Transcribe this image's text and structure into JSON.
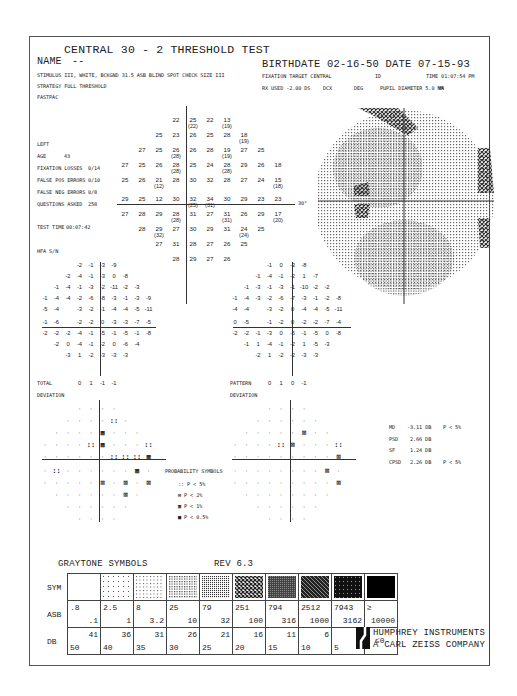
{
  "header": {
    "test_title": "CENTRAL 30 - 2 THRESHOLD TEST",
    "name_label": "NAME",
    "name_value": "--",
    "stimulus": "STIMULUS  III, WHITE, BCKGND 31.5 ASB  BLIND SPOT CHECK SIZE  III",
    "strategy": "STRATEGY  FULL THRESHOLD",
    "fastpac": "FASTPAC",
    "birthdate_line": "BIRTHDATE  02-16-50 DATE  07-15-93",
    "fixation_target": "FIXATION TARGET   CENTRAL",
    "id_label": "ID",
    "time": "TIME  01:07:54 PM",
    "rx_used": "RX USED -2.00 DS",
    "dcx": "DCX",
    "deg": "DEG",
    "pupil": "PUPIL DIAMETER 5.0 MM",
    "va": "VA"
  },
  "patient": {
    "eye": "LEFT",
    "age_label": "AGE",
    "age": "43",
    "fixation_losses_label": "FIXATION LOSSES",
    "fixation_losses": "0/14",
    "false_pos_label": "FALSE POS ERRORS",
    "false_pos": "0/10",
    "false_neg_label": "FALSE NEG ERRORS",
    "false_neg": "0/8",
    "questions_label": "QUESTIONS ASKED",
    "questions": "258",
    "test_time_label": "TEST TIME",
    "test_time": "00:07:42",
    "hfa_sn": "HFA S/N"
  },
  "threshold_rows": [
    [
      "22",
      "25(22)",
      "22",
      "13(19)"
    ],
    [
      "25",
      "23",
      "26",
      "25",
      "28",
      "18(19)"
    ],
    [
      "27",
      "25",
      "26(28)",
      "26",
      "28",
      "19(19)",
      "27",
      "25"
    ],
    [
      "27",
      "25",
      "26",
      "28(28)",
      "25",
      "24",
      "28(28)",
      "29",
      "26",
      "18"
    ],
    [
      "25",
      "26",
      "21(12)",
      "28",
      "30",
      "32",
      "28",
      "27",
      "24",
      "15(18)"
    ],
    [
      "29",
      "25",
      "12",
      "30",
      "32(25)",
      "34(31)",
      "30",
      "29",
      "23",
      "23"
    ],
    [
      "27",
      "28",
      "29",
      "28(28)",
      "31",
      "27",
      "31(31)",
      "26",
      "29",
      "17(20)"
    ],
    [
      "28",
      "29(32)",
      "27",
      "30",
      "29",
      "31",
      "24(24)",
      "25"
    ],
    [
      "27",
      "31",
      "28",
      "27",
      "26",
      "25"
    ],
    [
      "28",
      "29",
      "27",
      "26"
    ]
  ],
  "axis_label_30": "30°",
  "total_deviation": {
    "label1": "TOTAL",
    "label2": "DEVIATION",
    "rows": [
      [
        "-2",
        "-1",
        "-3",
        "-9"
      ],
      [
        "-2",
        "-4",
        "-1",
        "-3",
        "0",
        "-8"
      ],
      [
        "-1",
        "-4",
        "-1",
        "-3",
        "-2",
        "-11",
        "-2",
        "-3"
      ],
      [
        "-1",
        "-4",
        "-4",
        "-2",
        "-6",
        "-8",
        "-3",
        "-1",
        "-3",
        "-9"
      ],
      [
        "-5",
        "-4",
        "-3",
        "-2",
        "-1",
        "-4",
        "-4",
        "-5",
        "-11"
      ],
      [
        "-1",
        "-6",
        "-2",
        "-2",
        "0",
        "-3",
        "-3",
        "-7",
        "-5"
      ],
      [
        "-2",
        "-2",
        "-2",
        "-4",
        "-1",
        "-5",
        "-1",
        "-5",
        "-1",
        "-8"
      ],
      [
        "-2",
        "0",
        "-4",
        "-1",
        "-2",
        "0",
        "-6",
        "-4"
      ],
      [
        "-3",
        "1",
        "-2",
        "-3",
        "-3",
        "-3"
      ],
      [
        "0",
        "1",
        "-1",
        "-1"
      ]
    ]
  },
  "pattern_deviation": {
    "label1": "PATTERN",
    "label2": "DEVIATION",
    "rows": [
      [
        "-1",
        "0",
        "-3",
        "-8"
      ],
      [
        "-1",
        "-4",
        "-1",
        "-2",
        "1",
        "-7"
      ],
      [
        "-1",
        "-3",
        "-1",
        "-3",
        "-1",
        "-10",
        "-2",
        "-2"
      ],
      [
        "-1",
        "-4",
        "-3",
        "-2",
        "-6",
        "-7",
        "-3",
        "-1",
        "-2",
        "-8"
      ],
      [
        "-4",
        "-4",
        "-3",
        "-2",
        "0",
        "-4",
        "-4",
        "-5",
        "-11"
      ],
      [
        "0",
        "-5",
        "-1",
        "-2",
        "0",
        "-2",
        "-2",
        "-7",
        "-4"
      ],
      [
        "-2",
        "-2",
        "-1",
        "-3",
        "0",
        "-5",
        "-1",
        "-5",
        "0",
        "-8"
      ],
      [
        "-1",
        "1",
        "-4",
        "-1",
        "-2",
        "1",
        "-5",
        "-3"
      ],
      [
        "-2",
        "1",
        "-2",
        "-2",
        "-3",
        "-3"
      ],
      [
        "0",
        "1",
        "0",
        "-1"
      ]
    ]
  },
  "global_indices": [
    {
      "label": "MD",
      "value": "-3.11 DB",
      "p": "P <  5%"
    },
    {
      "label": "PSD",
      "value": "2.66 DB",
      "p": ""
    },
    {
      "label": "SF",
      "value": "1.24 DB",
      "p": ""
    },
    {
      "label": "CPSD",
      "value": "2.26 DB",
      "p": "P <  5%"
    }
  ],
  "probability_symbols": {
    "title": "PROBABILITY SYMBOLS",
    "items": [
      "P <  5%",
      "P <  2%",
      "P <  1%",
      "P < 0.5%"
    ]
  },
  "graytone": {
    "title": "GRAYTONE SYMBOLS",
    "rev": "REV 6.3",
    "sym_label": "SYM",
    "asb_label": "ASB",
    "db_label": "DB",
    "asb": [
      [
        ".8",
        ".1"
      ],
      [
        "2.5",
        "1"
      ],
      [
        "8",
        "3.2"
      ],
      [
        "25",
        "10"
      ],
      [
        "79",
        "32"
      ],
      [
        "251",
        "100"
      ],
      [
        "794",
        "316"
      ],
      [
        "2512",
        "1000"
      ],
      [
        "7943",
        "3162"
      ],
      [
        "≥",
        "10000"
      ]
    ],
    "db": [
      [
        "41",
        "50"
      ],
      [
        "36",
        "40"
      ],
      [
        "31",
        "35"
      ],
      [
        "26",
        "30"
      ],
      [
        "21",
        "25"
      ],
      [
        "16",
        "20"
      ],
      [
        "11",
        "15"
      ],
      [
        "6",
        "10"
      ],
      [
        "1",
        "5"
      ],
      [
        "≤0",
        ""
      ]
    ]
  },
  "brand": {
    "line1": "HUMPHREY INSTRUMENTS",
    "line2": "A CARL ZEISS COMPANY"
  }
}
